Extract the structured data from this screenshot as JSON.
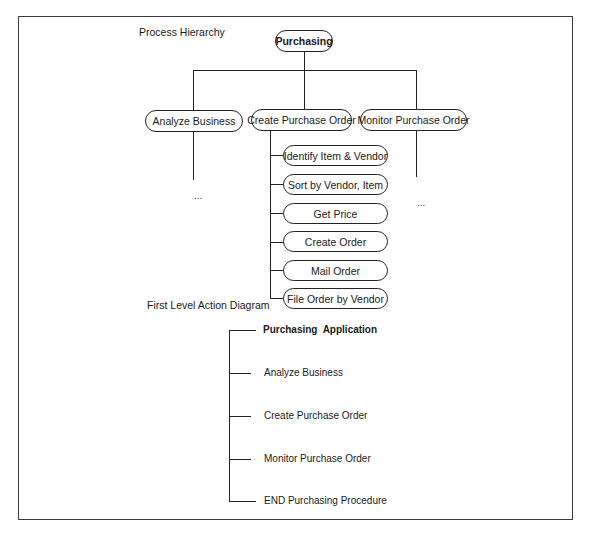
{
  "process_hierarchy": {
    "title": "Process Hierarchy",
    "root": {
      "label": "Purchasing"
    },
    "level1": [
      {
        "label": "Analyze Business",
        "continuation": "..."
      },
      {
        "label": "Create Purchase Order"
      },
      {
        "label": "Monitor Purchase Order",
        "continuation": "..."
      }
    ],
    "create_purchase_order_children": [
      {
        "label": "Identify Item & Vendor"
      },
      {
        "label": "Sort by Vendor, Item"
      },
      {
        "label": "Get Price"
      },
      {
        "label": "Create Order"
      },
      {
        "label": "Mail Order"
      },
      {
        "label": "File Order by Vendor"
      }
    ]
  },
  "action_diagram": {
    "title": "First Level Action Diagram",
    "items": [
      {
        "label": "Purchasing  Application"
      },
      {
        "label": "Analyze Business"
      },
      {
        "label": "Create Purchase Order"
      },
      {
        "label": "Monitor Purchase Order"
      },
      {
        "label": "END Purchasing Procedure"
      }
    ]
  }
}
